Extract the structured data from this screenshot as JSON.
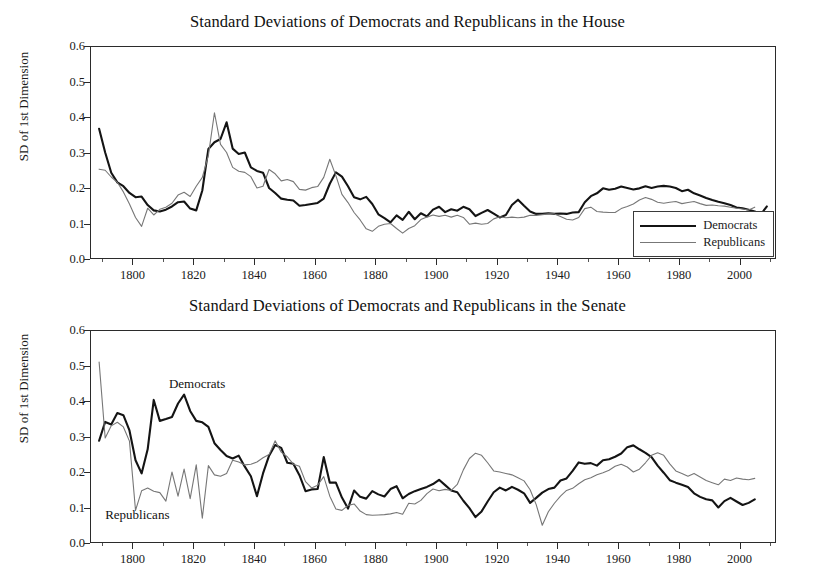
{
  "figure": {
    "background": "#ffffff",
    "panel_count": 2
  },
  "panels": [
    {
      "id": "house",
      "title": "Standard Deviations of Democrats and Republicans in the House",
      "ylabel": "SD of 1st Dimension",
      "legend": {
        "position": "bottom-right-inside",
        "entries": [
          {
            "label": "Democrats",
            "color": "#141414",
            "width": 2.2
          },
          {
            "label": "Republicans",
            "color": "#777777",
            "width": 1.1
          }
        ]
      }
    },
    {
      "id": "senate",
      "title": "Standard Deviations of Democrats and Republicans in the Senate",
      "ylabel": "SD of 1st Dimension",
      "annotations": [
        {
          "text": "Democrats",
          "x": 1812,
          "y": 0.445
        },
        {
          "text": "Republicans",
          "x": 1791,
          "y": 0.075
        }
      ]
    }
  ],
  "axes": {
    "yticks": [
      "0.0",
      "0.1",
      "0.2",
      "0.3",
      "0.4",
      "0.5",
      "0.6"
    ],
    "ytick_values": [
      0.0,
      0.1,
      0.2,
      0.3,
      0.4,
      0.5,
      0.6
    ],
    "ylim": [
      0.0,
      0.6
    ],
    "xticks": [
      "1800",
      "1820",
      "1840",
      "1860",
      "1880",
      "1900",
      "1920",
      "1940",
      "1960",
      "1980",
      "2000"
    ],
    "xtick_values": [
      1800,
      1820,
      1840,
      1860,
      1880,
      1900,
      1920,
      1940,
      1960,
      1980,
      2000
    ],
    "xlim": [
      1786,
      2012
    ],
    "xminor_step": 10,
    "grid": false
  },
  "shaded_bands": {
    "color": "#d4d4d4",
    "ranges": [
      {
        "start": 1790,
        "end": 1825
      },
      {
        "start": 1860,
        "end": 1932
      }
    ]
  },
  "chart_data": [
    {
      "type": "line",
      "title": "Standard Deviations of Democrats and Republicans in the House",
      "xlabel": "",
      "ylabel": "SD of 1st Dimension",
      "xlim": [
        1786,
        2012
      ],
      "ylim": [
        0.0,
        0.6
      ],
      "grid": false,
      "legend": "bottom-right",
      "shaded_bands": [
        [
          1790,
          1825
        ],
        [
          1860,
          1932
        ]
      ],
      "series": [
        {
          "name": "Democrats",
          "color": "#141414",
          "x": [
            1789,
            1791,
            1793,
            1795,
            1797,
            1799,
            1801,
            1803,
            1805,
            1807,
            1809,
            1811,
            1813,
            1815,
            1817,
            1819,
            1821,
            1823,
            1825,
            1827,
            1829,
            1831,
            1833,
            1835,
            1837,
            1839,
            1841,
            1843,
            1845,
            1847,
            1849,
            1851,
            1853,
            1855,
            1857,
            1859,
            1861,
            1863,
            1865,
            1867,
            1869,
            1871,
            1873,
            1875,
            1877,
            1879,
            1881,
            1883,
            1885,
            1887,
            1889,
            1891,
            1893,
            1895,
            1897,
            1899,
            1901,
            1903,
            1905,
            1907,
            1909,
            1911,
            1913,
            1915,
            1917,
            1919,
            1921,
            1923,
            1925,
            1927,
            1929,
            1931,
            1933,
            1935,
            1937,
            1939,
            1941,
            1943,
            1945,
            1947,
            1949,
            1951,
            1953,
            1955,
            1957,
            1959,
            1961,
            1963,
            1965,
            1967,
            1969,
            1971,
            1973,
            1975,
            1977,
            1979,
            1981,
            1983,
            1985,
            1987,
            1989,
            1991,
            1993,
            1995,
            1997,
            1999,
            2001,
            2003,
            2005,
            2007,
            2009
          ],
          "y": [
            0.367,
            0.3,
            0.243,
            0.216,
            0.205,
            0.186,
            0.174,
            0.176,
            0.152,
            0.137,
            0.134,
            0.139,
            0.148,
            0.16,
            0.162,
            0.142,
            0.137,
            0.193,
            0.31,
            0.329,
            0.338,
            0.385,
            0.311,
            0.296,
            0.3,
            0.258,
            0.248,
            0.243,
            0.2,
            0.186,
            0.17,
            0.167,
            0.165,
            0.15,
            0.152,
            0.155,
            0.158,
            0.17,
            0.212,
            0.244,
            0.232,
            0.205,
            0.174,
            0.168,
            0.175,
            0.155,
            0.126,
            0.115,
            0.103,
            0.123,
            0.11,
            0.133,
            0.112,
            0.129,
            0.12,
            0.139,
            0.147,
            0.132,
            0.14,
            0.136,
            0.147,
            0.14,
            0.121,
            0.13,
            0.138,
            0.128,
            0.117,
            0.124,
            0.152,
            0.167,
            0.15,
            0.134,
            0.127,
            0.127,
            0.129,
            0.127,
            0.128,
            0.127,
            0.131,
            0.132,
            0.16,
            0.177,
            0.185,
            0.199,
            0.195,
            0.198,
            0.204,
            0.2,
            0.196,
            0.199,
            0.205,
            0.2,
            0.204,
            0.206,
            0.204,
            0.2,
            0.191,
            0.195,
            0.185,
            0.179,
            0.172,
            0.166,
            0.161,
            0.157,
            0.152,
            0.145,
            0.143,
            0.139,
            0.134,
            0.126,
            0.148
          ]
        },
        {
          "name": "Republicans",
          "color": "#777777",
          "x": [
            1789,
            1791,
            1793,
            1795,
            1797,
            1799,
            1801,
            1803,
            1805,
            1807,
            1809,
            1811,
            1813,
            1815,
            1817,
            1819,
            1821,
            1823,
            1825,
            1827,
            1829,
            1831,
            1833,
            1835,
            1837,
            1839,
            1841,
            1843,
            1845,
            1847,
            1849,
            1851,
            1853,
            1855,
            1857,
            1859,
            1861,
            1863,
            1865,
            1867,
            1869,
            1871,
            1873,
            1875,
            1877,
            1879,
            1881,
            1883,
            1885,
            1887,
            1889,
            1891,
            1893,
            1895,
            1897,
            1899,
            1901,
            1903,
            1905,
            1907,
            1909,
            1911,
            1913,
            1915,
            1917,
            1919,
            1921,
            1923,
            1925,
            1927,
            1929,
            1931,
            1933,
            1935,
            1937,
            1939,
            1941,
            1943,
            1945,
            1947,
            1949,
            1951,
            1953,
            1955,
            1957,
            1959,
            1961,
            1963,
            1965,
            1967,
            1969,
            1971,
            1973,
            1975,
            1977,
            1979,
            1981,
            1983,
            1985,
            1987,
            1989,
            1991,
            1993,
            1995,
            1997,
            1999,
            2001,
            2003,
            2005,
            2007,
            2009
          ],
          "y": [
            0.253,
            0.25,
            0.231,
            0.216,
            0.189,
            0.155,
            0.117,
            0.092,
            0.143,
            0.124,
            0.14,
            0.146,
            0.157,
            0.18,
            0.188,
            0.176,
            0.205,
            0.23,
            0.292,
            0.412,
            0.323,
            0.3,
            0.258,
            0.247,
            0.244,
            0.232,
            0.2,
            0.205,
            0.252,
            0.24,
            0.22,
            0.224,
            0.218,
            0.196,
            0.194,
            0.201,
            0.204,
            0.23,
            0.281,
            0.235,
            0.182,
            0.159,
            0.131,
            0.11,
            0.085,
            0.078,
            0.092,
            0.098,
            0.1,
            0.086,
            0.073,
            0.086,
            0.094,
            0.111,
            0.118,
            0.124,
            0.12,
            0.123,
            0.118,
            0.123,
            0.117,
            0.098,
            0.101,
            0.098,
            0.1,
            0.113,
            0.119,
            0.116,
            0.118,
            0.116,
            0.118,
            0.123,
            0.123,
            0.125,
            0.127,
            0.127,
            0.12,
            0.112,
            0.11,
            0.117,
            0.142,
            0.146,
            0.134,
            0.132,
            0.131,
            0.131,
            0.142,
            0.148,
            0.155,
            0.166,
            0.173,
            0.168,
            0.16,
            0.157,
            0.16,
            0.162,
            0.156,
            0.159,
            0.162,
            0.156,
            0.151,
            0.152,
            0.15,
            0.149,
            0.146,
            0.143,
            0.141,
            0.138,
            0.146
          ]
        }
      ]
    },
    {
      "type": "line",
      "title": "Standard Deviations of Democrats and Republicans in the Senate",
      "xlabel": "",
      "ylabel": "SD of 1st Dimension",
      "xlim": [
        1786,
        2012
      ],
      "ylim": [
        0.0,
        0.6
      ],
      "grid": false,
      "legend": "inline-annotations",
      "shaded_bands": [
        [
          1790,
          1825
        ],
        [
          1860,
          1932
        ]
      ],
      "series": [
        {
          "name": "Democrats",
          "color": "#141414",
          "x": [
            1789,
            1791,
            1793,
            1795,
            1797,
            1799,
            1801,
            1803,
            1805,
            1807,
            1809,
            1811,
            1813,
            1815,
            1817,
            1819,
            1821,
            1823,
            1825,
            1827,
            1829,
            1831,
            1833,
            1835,
            1837,
            1839,
            1841,
            1843,
            1845,
            1847,
            1849,
            1851,
            1853,
            1855,
            1857,
            1859,
            1861,
            1863,
            1865,
            1867,
            1869,
            1871,
            1873,
            1875,
            1877,
            1879,
            1881,
            1883,
            1885,
            1887,
            1889,
            1891,
            1893,
            1895,
            1897,
            1899,
            1901,
            1903,
            1905,
            1907,
            1909,
            1911,
            1913,
            1915,
            1917,
            1919,
            1921,
            1923,
            1925,
            1927,
            1929,
            1931,
            1933,
            1935,
            1937,
            1939,
            1941,
            1943,
            1945,
            1947,
            1949,
            1951,
            1953,
            1955,
            1957,
            1959,
            1961,
            1963,
            1965,
            1967,
            1969,
            1971,
            1973,
            1975,
            1977,
            1979,
            1981,
            1983,
            1985,
            1987,
            1989,
            1991,
            1993,
            1995,
            1997,
            1999,
            2001,
            2003,
            2005,
            2007,
            2009
          ],
          "y": [
            0.288,
            0.341,
            0.334,
            0.366,
            0.36,
            0.317,
            0.233,
            0.196,
            0.264,
            0.403,
            0.344,
            0.349,
            0.355,
            0.393,
            0.418,
            0.372,
            0.344,
            0.34,
            0.327,
            0.281,
            0.262,
            0.245,
            0.238,
            0.246,
            0.215,
            0.188,
            0.132,
            0.196,
            0.246,
            0.276,
            0.268,
            0.226,
            0.223,
            0.191,
            0.146,
            0.151,
            0.152,
            0.242,
            0.17,
            0.17,
            0.128,
            0.097,
            0.148,
            0.13,
            0.125,
            0.146,
            0.137,
            0.131,
            0.152,
            0.16,
            0.126,
            0.138,
            0.146,
            0.152,
            0.158,
            0.166,
            0.178,
            0.163,
            0.148,
            0.143,
            0.119,
            0.098,
            0.073,
            0.089,
            0.117,
            0.143,
            0.156,
            0.148,
            0.158,
            0.15,
            0.14,
            0.113,
            0.127,
            0.142,
            0.152,
            0.156,
            0.176,
            0.182,
            0.203,
            0.227,
            0.223,
            0.225,
            0.218,
            0.233,
            0.236,
            0.243,
            0.252,
            0.27,
            0.275,
            0.264,
            0.254,
            0.242,
            0.218,
            0.198,
            0.177,
            0.17,
            0.164,
            0.158,
            0.14,
            0.13,
            0.123,
            0.12,
            0.1,
            0.118,
            0.127,
            0.117,
            0.107,
            0.113,
            0.123
          ]
        },
        {
          "name": "Republicans",
          "color": "#777777",
          "x": [
            1789,
            1791,
            1793,
            1795,
            1797,
            1799,
            1801,
            1803,
            1805,
            1807,
            1809,
            1811,
            1813,
            1815,
            1817,
            1819,
            1821,
            1823,
            1825,
            1827,
            1829,
            1831,
            1833,
            1835,
            1837,
            1839,
            1841,
            1843,
            1845,
            1847,
            1849,
            1851,
            1853,
            1855,
            1857,
            1859,
            1861,
            1863,
            1865,
            1867,
            1869,
            1871,
            1873,
            1875,
            1877,
            1879,
            1881,
            1883,
            1885,
            1887,
            1889,
            1891,
            1893,
            1895,
            1897,
            1899,
            1901,
            1903,
            1905,
            1907,
            1909,
            1911,
            1913,
            1915,
            1917,
            1919,
            1921,
            1923,
            1925,
            1927,
            1929,
            1931,
            1933,
            1935,
            1937,
            1939,
            1941,
            1943,
            1945,
            1947,
            1949,
            1951,
            1953,
            1955,
            1957,
            1959,
            1961,
            1963,
            1965,
            1967,
            1969,
            1971,
            1973,
            1975,
            1977,
            1979,
            1981,
            1983,
            1985,
            1987,
            1989,
            1991,
            1993,
            1995,
            1997,
            1999,
            2001,
            2003,
            2005,
            2007,
            2009
          ],
          "y": [
            0.51,
            0.296,
            0.33,
            0.34,
            0.327,
            0.287,
            0.092,
            0.147,
            0.155,
            0.146,
            0.142,
            0.118,
            0.2,
            0.132,
            0.208,
            0.125,
            0.22,
            0.07,
            0.218,
            0.192,
            0.188,
            0.196,
            0.233,
            0.228,
            0.22,
            0.222,
            0.228,
            0.24,
            0.249,
            0.288,
            0.256,
            0.243,
            0.222,
            0.216,
            0.173,
            0.155,
            0.163,
            0.187,
            0.132,
            0.096,
            0.092,
            0.106,
            0.11,
            0.09,
            0.08,
            0.078,
            0.079,
            0.08,
            0.082,
            0.086,
            0.081,
            0.112,
            0.11,
            0.12,
            0.139,
            0.152,
            0.147,
            0.151,
            0.148,
            0.165,
            0.206,
            0.238,
            0.253,
            0.247,
            0.226,
            0.203,
            0.2,
            0.196,
            0.192,
            0.184,
            0.175,
            0.15,
            0.108,
            0.05,
            0.088,
            0.112,
            0.132,
            0.148,
            0.154,
            0.167,
            0.178,
            0.184,
            0.192,
            0.198,
            0.205,
            0.216,
            0.222,
            0.214,
            0.2,
            0.208,
            0.226,
            0.247,
            0.254,
            0.247,
            0.223,
            0.203,
            0.196,
            0.188,
            0.196,
            0.186,
            0.176,
            0.17,
            0.164,
            0.18,
            0.176,
            0.183,
            0.18,
            0.178,
            0.182
          ]
        }
      ]
    }
  ]
}
